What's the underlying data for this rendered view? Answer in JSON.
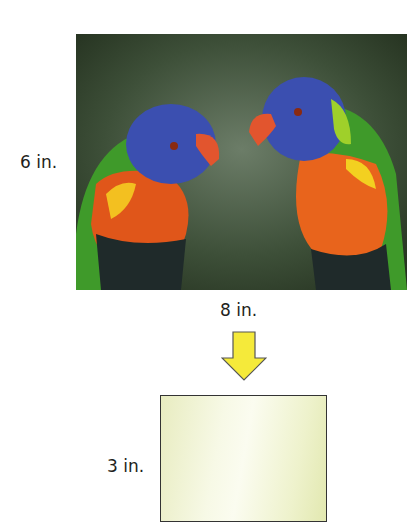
{
  "diagram": {
    "original": {
      "height_label": "6 in.",
      "width_label": "8 in.",
      "image_description": "Two rainbow lorikeets perched facing each other"
    },
    "arrow": {
      "direction": "down",
      "color": "#f5ea3a"
    },
    "scaled": {
      "height_label": "3 in.",
      "fill_color": "#f3f6d8"
    }
  }
}
